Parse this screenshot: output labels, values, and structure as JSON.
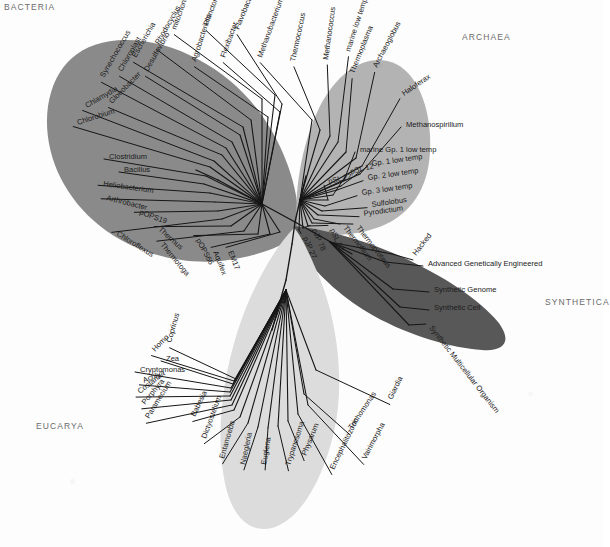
{
  "figure": {
    "type": "phylogenetic-tree",
    "background_color": "#fdfdfd"
  },
  "domains": [
    {
      "id": "bacteria",
      "label": "BACTERIA",
      "color": "#8a8a8a",
      "label_x": 4,
      "label_y": 2
    },
    {
      "id": "archaea",
      "label": "ARCHAEA",
      "color": "#b3b3b3",
      "label_x": 462,
      "label_y": 32
    },
    {
      "id": "eucarya",
      "label": "EUCARYA",
      "color": "#dcdcdc",
      "label_x": 36,
      "label_y": 421
    },
    {
      "id": "synthetica",
      "label": "SYNTHETICA",
      "color": "#585858",
      "label_x": 545,
      "label_y": 297
    }
  ],
  "colors": {
    "bacteria_fill": "#8a8a8a",
    "archaea_fill": "#b3b3b3",
    "eucarya_fill": "#dcdcdc",
    "synthetica_fill": "#585858",
    "branch_dark": "#161616",
    "branch_light": "#3a3a3a",
    "label_text": "#1b1b1b",
    "domain_text": "#6b6b6b",
    "page_background": "#fdfdfd"
  },
  "root": {
    "x": 295,
    "y": 222
  },
  "taxa": {
    "bacteria": [
      {
        "name": "mitochondria",
        "lx": 176,
        "ly": 30,
        "rot": -70,
        "tipx": 262,
        "tipy": 99,
        "anchor": "start"
      },
      {
        "name": "Planctomyces",
        "lx": 208,
        "ly": 26,
        "rot": -70,
        "tipx": 275,
        "tipy": 95,
        "anchor": "start"
      },
      {
        "name": "Flavobacterium",
        "lx": 239,
        "ly": 30,
        "rot": -68,
        "tipx": 282,
        "tipy": 104,
        "anchor": "start"
      },
      {
        "name": "Flexibacter",
        "lx": 225,
        "ly": 58,
        "rot": -70,
        "tipx": 280,
        "tipy": 112,
        "anchor": "start"
      },
      {
        "name": "Agrobacterium",
        "lx": 196,
        "ly": 62,
        "rot": -72,
        "tipx": 268,
        "tipy": 117,
        "anchor": "start"
      },
      {
        "name": "Rhodocyclus",
        "lx": 159,
        "ly": 45,
        "rot": -60,
        "tipx": 251,
        "tipy": 120,
        "anchor": "start"
      },
      {
        "name": "Escherichia",
        "lx": 136,
        "ly": 58,
        "rot": -60,
        "tipx": 243,
        "tipy": 127,
        "anchor": "start"
      },
      {
        "name": "Desulfovibrio",
        "lx": 148,
        "ly": 72,
        "rot": -60,
        "tipx": 240,
        "tipy": 135,
        "anchor": "start"
      },
      {
        "name": "Chloroplast",
        "lx": 122,
        "ly": 72,
        "rot": -60,
        "tipx": 232,
        "tipy": 142,
        "anchor": "start"
      },
      {
        "name": "Synechococcus",
        "lx": 104,
        "ly": 78,
        "rot": -60,
        "tipx": 226,
        "tipy": 148,
        "anchor": "start"
      },
      {
        "name": "Gloeobacter",
        "lx": 112,
        "ly": 104,
        "rot": -45,
        "tipx": 222,
        "tipy": 155,
        "anchor": "start"
      },
      {
        "name": "Chlamydia",
        "lx": 87,
        "ly": 108,
        "rot": -30,
        "tipx": 214,
        "tipy": 161,
        "anchor": "start"
      },
      {
        "name": "Chlorobium",
        "lx": 78,
        "ly": 125,
        "rot": -18,
        "tipx": 210,
        "tipy": 167,
        "anchor": "start"
      },
      {
        "name": "Clostridium",
        "lx": 109,
        "ly": 159,
        "rot": 0,
        "tipx": 206,
        "tipy": 176,
        "anchor": "start"
      },
      {
        "name": "Bacillus",
        "lx": 124,
        "ly": 172,
        "rot": 0,
        "tipx": 204,
        "tipy": 184,
        "anchor": "start"
      },
      {
        "name": "Heliobacterium",
        "lx": 103,
        "ly": 186,
        "rot": 8,
        "tipx": 210,
        "tipy": 193,
        "anchor": "start"
      },
      {
        "name": "Arthrobacter",
        "lx": 106,
        "ly": 200,
        "rot": 14,
        "tipx": 215,
        "tipy": 202,
        "anchor": "start"
      },
      {
        "name": "pOPS19",
        "lx": 139,
        "ly": 214,
        "rot": 20,
        "tipx": 218,
        "tipy": 211,
        "anchor": "start"
      },
      {
        "name": "Chloroflexus",
        "lx": 116,
        "ly": 235,
        "rot": 32,
        "tipx": 222,
        "tipy": 219,
        "anchor": "start"
      },
      {
        "name": "Thermus",
        "lx": 158,
        "ly": 230,
        "rot": 42,
        "tipx": 231,
        "tipy": 226,
        "anchor": "start"
      },
      {
        "name": "Thermotoga",
        "lx": 160,
        "ly": 245,
        "rot": 50,
        "tipx": 244,
        "tipy": 231,
        "anchor": "start"
      },
      {
        "name": "pOPS66",
        "lx": 196,
        "ly": 240,
        "rot": 62,
        "tipx": 258,
        "tipy": 234,
        "anchor": "start"
      },
      {
        "name": "Aquifex",
        "lx": 213,
        "ly": 252,
        "rot": 68,
        "tipx": 270,
        "tipy": 234,
        "anchor": "start"
      },
      {
        "name": "EM17",
        "lx": 228,
        "ly": 252,
        "rot": 68,
        "tipx": 280,
        "tipy": 232,
        "anchor": "start"
      }
    ],
    "archaea": [
      {
        "name": "Methanobacterium",
        "lx": 262,
        "ly": 58,
        "rot": -70,
        "tipx": 312,
        "tipy": 120,
        "anchor": "start"
      },
      {
        "name": "Thermococcus",
        "lx": 295,
        "ly": 62,
        "rot": -78,
        "tipx": 320,
        "tipy": 130,
        "anchor": "start"
      },
      {
        "name": "Methanococcus",
        "lx": 328,
        "ly": 60,
        "rot": -82,
        "tipx": 330,
        "tipy": 136,
        "anchor": "start"
      },
      {
        "name": "marine low temp",
        "lx": 350,
        "ly": 52,
        "rot": -72,
        "tipx": 338,
        "tipy": 142,
        "anchor": "start"
      },
      {
        "name": "Thermoplasma",
        "lx": 354,
        "ly": 74,
        "rot": -68,
        "tipx": 346,
        "tipy": 152,
        "anchor": "start"
      },
      {
        "name": "Archaeoglobus",
        "lx": 377,
        "ly": 68,
        "rot": -62,
        "tipx": 356,
        "tipy": 158,
        "anchor": "start"
      },
      {
        "name": "Haloferax",
        "lx": 404,
        "ly": 96,
        "rot": -34,
        "tipx": 362,
        "tipy": 166,
        "anchor": "start"
      },
      {
        "name": "Methanospirillum",
        "lx": 406,
        "ly": 127,
        "rot": 0,
        "tipx": 360,
        "tipy": 174,
        "anchor": "start"
      },
      {
        "name": "marine Gp. 1 low temp",
        "lx": 360,
        "ly": 152,
        "rot": 0,
        "tipx": 344,
        "tipy": 180,
        "anchor": "start"
      },
      {
        "name": "Gp. 1 low temp",
        "lx": 372,
        "ly": 166,
        "rot": -8,
        "tipx": 341,
        "tipy": 186,
        "anchor": "start"
      },
      {
        "name": "Gp. 2 low temp",
        "lx": 368,
        "ly": 180,
        "rot": -8,
        "tipx": 337,
        "tipy": 190,
        "anchor": "start"
      },
      {
        "name": "pSL 12",
        "lx": 351,
        "ly": 174,
        "rot": -14,
        "tipx": 333,
        "tipy": 195,
        "anchor": "start"
      },
      {
        "name": "pSL 22",
        "lx": 329,
        "ly": 184,
        "rot": -14,
        "tipx": 328,
        "tipy": 200,
        "anchor": "start"
      },
      {
        "name": "Gp. 3 low temp",
        "lx": 362,
        "ly": 195,
        "rot": -8,
        "tipx": 325,
        "tipy": 206,
        "anchor": "start"
      },
      {
        "name": "Sulfolobus",
        "lx": 372,
        "ly": 207,
        "rot": -8,
        "tipx": 322,
        "tipy": 211,
        "anchor": "start"
      },
      {
        "name": "Pyrodictium",
        "lx": 364,
        "ly": 216,
        "rot": -8,
        "tipx": 318,
        "tipy": 215,
        "anchor": "start"
      },
      {
        "name": "Thermofilum",
        "lx": 343,
        "ly": 228,
        "rot": 52,
        "tipx": 314,
        "tipy": 219,
        "anchor": "start"
      },
      {
        "name": "Thermoproteus",
        "lx": 356,
        "ly": 228,
        "rot": 52,
        "tipx": 312,
        "tipy": 223,
        "anchor": "start"
      },
      {
        "name": "pSL 50",
        "lx": 330,
        "ly": 230,
        "rot": 66,
        "tipx": 308,
        "tipy": 226,
        "anchor": "start"
      },
      {
        "name": "pJP 78",
        "lx": 312,
        "ly": 230,
        "rot": 66,
        "tipx": 303,
        "tipy": 228,
        "anchor": "start"
      },
      {
        "name": "pJP 27",
        "lx": 303,
        "ly": 238,
        "rot": 66,
        "tipx": 299,
        "tipy": 230,
        "anchor": "start"
      }
    ],
    "synthetica": [
      {
        "name": "Hacked",
        "lx": 416,
        "ly": 256,
        "rot": -52,
        "tipx": 392,
        "tipy": 254,
        "anchor": "start"
      },
      {
        "name": "Advanced Genetically Engineered",
        "lx": 428,
        "ly": 266,
        "rot": 0,
        "tipx": 385,
        "tipy": 262,
        "anchor": "start"
      },
      {
        "name": "Synthetic Genome",
        "lx": 434,
        "ly": 292,
        "rot": 0,
        "tipx": 393,
        "tipy": 289,
        "anchor": "start"
      },
      {
        "name": "Synthetic Cell",
        "lx": 434,
        "ly": 310,
        "rot": 0,
        "tipx": 400,
        "tipy": 307,
        "anchor": "start"
      },
      {
        "name": "Synthetic Multicellular Organism",
        "lx": 429,
        "ly": 328,
        "rot": 52,
        "tipx": 409,
        "tipy": 325,
        "anchor": "start"
      }
    ],
    "eucarya": [
      {
        "name": "Coprinus",
        "lx": 171,
        "ly": 343,
        "rot": -74,
        "tipx": 236,
        "tipy": 379,
        "anchor": "start"
      },
      {
        "name": "Homo",
        "lx": 155,
        "ly": 352,
        "rot": -46,
        "tipx": 234,
        "tipy": 381,
        "anchor": "start"
      },
      {
        "name": "Zea",
        "lx": 166,
        "ly": 361,
        "rot": 0,
        "tipx": 233,
        "tipy": 384,
        "anchor": "start"
      },
      {
        "name": "Cryptomonas",
        "lx": 140,
        "ly": 372,
        "rot": 0,
        "tipx": 231,
        "tipy": 388,
        "anchor": "start"
      },
      {
        "name": "Achlya",
        "lx": 144,
        "ly": 383,
        "rot": -22,
        "tipx": 230,
        "tipy": 392,
        "anchor": "start"
      },
      {
        "name": "Costaria",
        "lx": 140,
        "ly": 394,
        "rot": -38,
        "tipx": 230,
        "tipy": 396,
        "anchor": "start"
      },
      {
        "name": "Porphyra",
        "lx": 145,
        "ly": 405,
        "rot": -50,
        "tipx": 231,
        "tipy": 400,
        "anchor": "start"
      },
      {
        "name": "Paramecium",
        "lx": 149,
        "ly": 419,
        "rot": -58,
        "tipx": 232,
        "tipy": 405,
        "anchor": "start"
      },
      {
        "name": "Babesia",
        "lx": 195,
        "ly": 417,
        "rot": -64,
        "tipx": 234,
        "tipy": 410,
        "anchor": "start"
      },
      {
        "name": "Dictyostelium",
        "lx": 206,
        "ly": 439,
        "rot": -70,
        "tipx": 240,
        "tipy": 417,
        "anchor": "start"
      },
      {
        "name": "Entamoeba",
        "lx": 224,
        "ly": 459,
        "rot": -74,
        "tipx": 248,
        "tipy": 423,
        "anchor": "start"
      },
      {
        "name": "Naegleria",
        "lx": 245,
        "ly": 465,
        "rot": -78,
        "tipx": 258,
        "tipy": 427,
        "anchor": "start"
      },
      {
        "name": "Euglena",
        "lx": 266,
        "ly": 465,
        "rot": -80,
        "tipx": 268,
        "tipy": 428,
        "anchor": "start"
      },
      {
        "name": "Trypanosoma",
        "lx": 290,
        "ly": 466,
        "rot": -72,
        "tipx": 278,
        "tipy": 426,
        "anchor": "start"
      },
      {
        "name": "Physarum",
        "lx": 306,
        "ly": 456,
        "rot": -68,
        "tipx": 288,
        "tipy": 421,
        "anchor": "start"
      },
      {
        "name": "Encephalitozoon",
        "lx": 334,
        "ly": 470,
        "rot": -64,
        "tipx": 298,
        "tipy": 414,
        "anchor": "start"
      },
      {
        "name": "Vairimorpha",
        "lx": 366,
        "ly": 460,
        "rot": -62,
        "tipx": 308,
        "tipy": 405,
        "anchor": "start"
      },
      {
        "name": "Trichomonas",
        "lx": 352,
        "ly": 430,
        "rot": -56,
        "tipx": 304,
        "tipy": 394,
        "anchor": "start"
      },
      {
        "name": "Giardia",
        "lx": 392,
        "ly": 400,
        "rot": -64,
        "tipx": 316,
        "tipy": 370,
        "anchor": "start"
      }
    ]
  }
}
